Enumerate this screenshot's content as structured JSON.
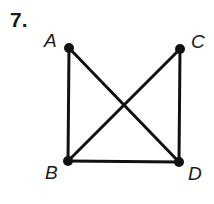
{
  "problem": {
    "number": "7."
  },
  "diagram": {
    "stroke_color": "#111111",
    "vertices": [
      {
        "id": "A",
        "label": "A",
        "x": 69,
        "y": 48,
        "label_x": 44,
        "label_y": 31
      },
      {
        "id": "C",
        "label": "C",
        "x": 180,
        "y": 49,
        "label_x": 191,
        "label_y": 32
      },
      {
        "id": "B",
        "label": "B",
        "x": 68,
        "y": 161,
        "label_x": 45,
        "label_y": 163
      },
      {
        "id": "D",
        "label": "D",
        "x": 179,
        "y": 162,
        "label_x": 188,
        "label_y": 164
      }
    ],
    "edges": [
      {
        "from": "A",
        "to": "B"
      },
      {
        "from": "A",
        "to": "D"
      },
      {
        "from": "C",
        "to": "B"
      },
      {
        "from": "C",
        "to": "D"
      },
      {
        "from": "B",
        "to": "D"
      }
    ]
  }
}
